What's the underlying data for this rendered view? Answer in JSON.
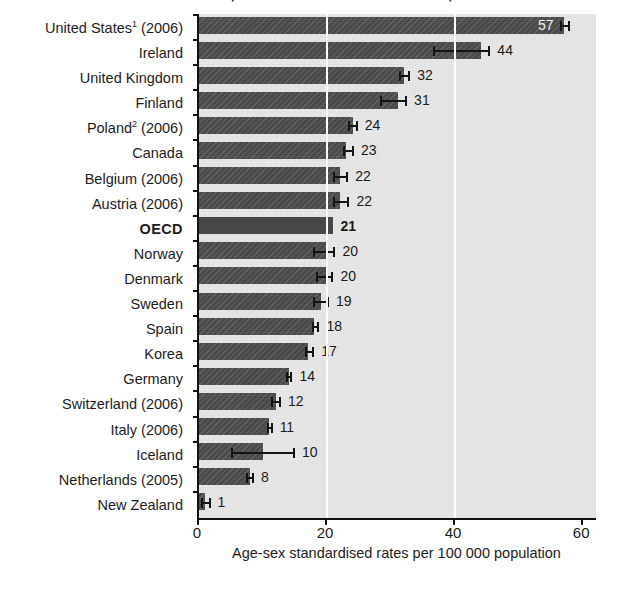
{
  "chart_data": {
    "type": "bar",
    "orientation": "horizontal",
    "title": "Suicide rates, selected OECD countries, 2007",
    "xlabel": "Age-sex standardised rates per 100 000 population",
    "ylabel": "",
    "xlim": [
      0,
      62
    ],
    "xticks": [
      0,
      20,
      40,
      60
    ],
    "xticklabels": [
      "0",
      "20",
      "40",
      "60"
    ],
    "grid": "vertical-white-gridlines-at-xticks",
    "legend": "none",
    "categories": [
      "United States¹ (2006)",
      "Ireland",
      "United Kingdom",
      "Finland",
      "Poland² (2006)",
      "Canada",
      "Belgium (2006)",
      "Austria (2006)",
      "OECD",
      "Norway",
      "Denmark",
      "Sweden",
      "Spain",
      "Korea",
      "Germany",
      "Switzerland (2006)",
      "Italy (2006)",
      "Iceland",
      "Netherlands (2005)",
      "New Zealand"
    ],
    "values": [
      57,
      44,
      32,
      31,
      24,
      23,
      22,
      22,
      21,
      20,
      20,
      19,
      18,
      17,
      14,
      12,
      11,
      10,
      8,
      1
    ],
    "value_labels": [
      "57",
      "44",
      "32",
      "31",
      "24",
      "23",
      "22",
      "22",
      "21",
      "20",
      "20",
      "19",
      "18",
      "17",
      "14",
      "12",
      "11",
      "10",
      "8",
      "1"
    ],
    "error_bars": [
      {
        "low": 56.3,
        "high": 58.0
      },
      {
        "low": 36.5,
        "high": 45.5
      },
      {
        "low": 31.3,
        "high": 33.0
      },
      {
        "low": 28.3,
        "high": 32.5
      },
      {
        "low": 23.3,
        "high": 24.8
      },
      {
        "low": 22.5,
        "high": 24.2
      },
      {
        "low": 21.0,
        "high": 23.3
      },
      {
        "low": 21.0,
        "high": 23.5
      },
      {
        "low": null,
        "high": null
      },
      {
        "low": 17.8,
        "high": 21.3
      },
      {
        "low": 18.3,
        "high": 21.0
      },
      {
        "low": 17.8,
        "high": 20.3
      },
      {
        "low": 17.6,
        "high": 18.8
      },
      {
        "low": 16.5,
        "high": 18.0
      },
      {
        "low": 13.6,
        "high": 14.6
      },
      {
        "low": 11.2,
        "high": 12.8
      },
      {
        "low": 10.6,
        "high": 11.5
      },
      {
        "low": 5.0,
        "high": 15.0
      },
      {
        "low": 7.3,
        "high": 8.6
      },
      {
        "low": 0.3,
        "high": 1.8
      }
    ],
    "highlight_category": "OECD",
    "highlight_style": "bold-label-solid-bar-no-error-bar",
    "bar_color": "#4b4b4b",
    "plot_background_color": "#e6e6e6",
    "gridline_color": "#ffffff",
    "axis_color": "#111111"
  }
}
